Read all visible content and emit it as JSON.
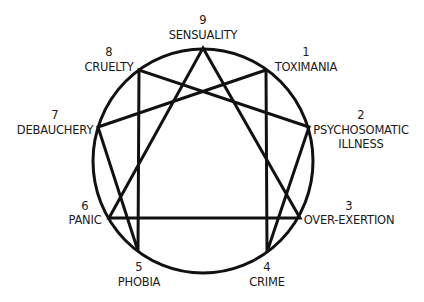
{
  "diagram": {
    "type": "enneagram",
    "circle": {
      "cx": 203,
      "cy": 161,
      "rx": 110,
      "ry": 112
    },
    "points": [
      {
        "num": "1",
        "label": "TOXIMANIA",
        "x": 266,
        "y": 70
      },
      {
        "num": "2",
        "label": "PSYCHOSOMATIC",
        "label2": "ILLNESS",
        "x": 309,
        "y": 127
      },
      {
        "num": "3",
        "label": "OVER-EXERTION",
        "x": 300,
        "y": 218
      },
      {
        "num": "4",
        "label": "CRIME",
        "x": 267,
        "y": 252
      },
      {
        "num": "5",
        "label": "PHOBIA",
        "x": 138,
        "y": 251
      },
      {
        "num": "6",
        "label": "PANIC",
        "x": 109,
        "y": 218
      },
      {
        "num": "7",
        "label": "DEBAUCHERY",
        "x": 98,
        "y": 127
      },
      {
        "num": "8",
        "label": "CRUELTY",
        "x": 139,
        "y": 70
      },
      {
        "num": "9",
        "label": "SENSUALITY",
        "x": 203,
        "y": 48
      }
    ],
    "hexad_sequence": [
      "1",
      "4",
      "2",
      "8",
      "5",
      "7",
      "1"
    ],
    "triangle_sequence": [
      "9",
      "3",
      "6",
      "9"
    ],
    "line_color": "#111111",
    "text_color": "#1a1a1a"
  }
}
